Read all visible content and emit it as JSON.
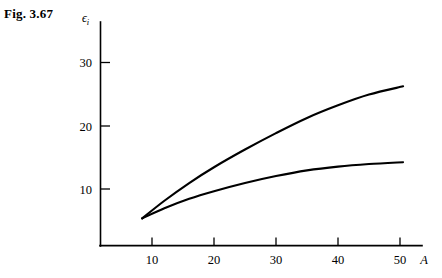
{
  "figure": {
    "label": "Fig. 3.67"
  },
  "chart_data": {
    "type": "line",
    "title": "",
    "xlabel": "A",
    "ylabel": "ϵ",
    "ylabel_subscript": "i",
    "xlim": [
      5,
      53
    ],
    "ylim": [
      0,
      35
    ],
    "xticks": [
      10,
      20,
      30,
      40,
      50
    ],
    "xtick_labels": [
      "10",
      "20",
      "30",
      "40",
      "50"
    ],
    "yticks": [
      10,
      20,
      30
    ],
    "ytick_labels": [
      "10",
      "20",
      "30"
    ],
    "grid": false,
    "legend": "none",
    "series": [
      {
        "name": "upper-curve",
        "x": [
          8.4,
          12,
          16,
          20,
          25,
          30,
          35,
          40,
          45,
          50.5
        ],
        "values": [
          4.3,
          7.1,
          9.9,
          12.4,
          15.2,
          17.8,
          20.2,
          22.2,
          23.9,
          25.2
        ]
      },
      {
        "name": "lower-curve",
        "x": [
          8.4,
          12,
          16,
          20,
          25,
          30,
          35,
          40,
          45,
          50.5
        ],
        "values": [
          4.3,
          5.9,
          7.4,
          8.6,
          9.9,
          11.0,
          11.9,
          12.5,
          12.9,
          13.2
        ]
      }
    ]
  },
  "colors": {
    "axis": "#000000",
    "curve": "#000000",
    "background": "#ffffff"
  }
}
